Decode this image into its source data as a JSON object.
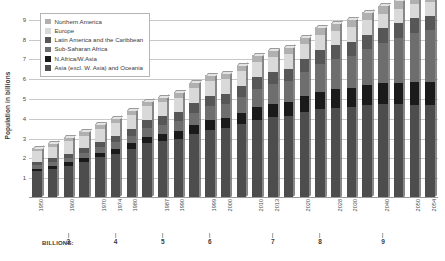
{
  "chart_data": {
    "type": "bar",
    "stacked": true,
    "title": "",
    "xlabel": "",
    "ylabel": "Population in billions",
    "ylim": [
      0,
      9.4
    ],
    "yticks": [
      1,
      2,
      3,
      4,
      5,
      6,
      7,
      8,
      9
    ],
    "grid": true,
    "legend_position": "top-left",
    "categories": [
      "1950",
      "1955",
      "1960",
      "1965",
      "1970",
      "1974",
      "1980",
      "1985",
      "1987",
      "1990",
      "1995",
      "1999",
      "2000",
      "2005",
      "2010",
      "2013",
      "2015",
      "2020",
      "2025",
      "2028",
      "2030",
      "2035",
      "2040",
      "2045",
      "2050",
      "2054"
    ],
    "tick_labels_shown": [
      "1950",
      "1960",
      "1970",
      "1974",
      "1980",
      "1987",
      "1990",
      "1999",
      "2000",
      "2010",
      "2013",
      "2020",
      "2028",
      "2030",
      "2040",
      "2050",
      "2054"
    ],
    "series": [
      {
        "name": "Asia (excl. W. Asia) and Oceania",
        "color": "#4d4d4d",
        "values": [
          1.36,
          1.49,
          1.64,
          1.83,
          2.06,
          2.25,
          2.49,
          2.76,
          2.87,
          2.99,
          3.26,
          3.46,
          3.52,
          3.74,
          3.96,
          4.08,
          4.15,
          4.35,
          4.5,
          4.57,
          4.61,
          4.69,
          4.73,
          4.73,
          4.71,
          4.69
        ]
      },
      {
        "name": "N.Africa/W.Asia",
        "color": "#1a1a1a",
        "values": [
          0.12,
          0.14,
          0.16,
          0.18,
          0.21,
          0.24,
          0.28,
          0.33,
          0.36,
          0.39,
          0.45,
          0.5,
          0.52,
          0.58,
          0.65,
          0.69,
          0.72,
          0.8,
          0.88,
          0.92,
          0.95,
          1.01,
          1.06,
          1.1,
          1.14,
          1.16
        ]
      },
      {
        "name": "Sub-Saharan Africa",
        "color": "#6e6e6e",
        "values": [
          0.18,
          0.2,
          0.23,
          0.26,
          0.29,
          0.32,
          0.38,
          0.44,
          0.48,
          0.52,
          0.61,
          0.68,
          0.7,
          0.8,
          0.92,
          0.99,
          1.04,
          1.22,
          1.41,
          1.53,
          1.61,
          1.82,
          2.04,
          2.26,
          2.49,
          2.62
        ]
      },
      {
        "name": "Latin America and the Caribbean",
        "color": "#575757",
        "values": [
          0.17,
          0.19,
          0.22,
          0.25,
          0.29,
          0.32,
          0.36,
          0.4,
          0.43,
          0.45,
          0.49,
          0.52,
          0.53,
          0.56,
          0.6,
          0.62,
          0.63,
          0.66,
          0.69,
          0.7,
          0.71,
          0.73,
          0.74,
          0.75,
          0.75,
          0.75
        ]
      },
      {
        "name": "Europe",
        "color": "#d9d9d9",
        "values": [
          0.55,
          0.58,
          0.61,
          0.64,
          0.66,
          0.68,
          0.69,
          0.71,
          0.72,
          0.72,
          0.73,
          0.73,
          0.73,
          0.73,
          0.74,
          0.74,
          0.74,
          0.75,
          0.74,
          0.74,
          0.74,
          0.73,
          0.72,
          0.71,
          0.7,
          0.69
        ]
      },
      {
        "name": "Northern America",
        "color": "#b0b0b0",
        "values": [
          0.17,
          0.19,
          0.2,
          0.22,
          0.23,
          0.24,
          0.25,
          0.27,
          0.27,
          0.28,
          0.3,
          0.31,
          0.31,
          0.33,
          0.34,
          0.36,
          0.36,
          0.38,
          0.4,
          0.41,
          0.41,
          0.43,
          0.44,
          0.45,
          0.46,
          0.47
        ]
      }
    ],
    "totals": [
      2.55,
      2.79,
      3.06,
      3.38,
      3.74,
      4.05,
      4.45,
      4.91,
      5.13,
      5.35,
      5.84,
      6.2,
      6.31,
      6.74,
      7.21,
      7.48,
      7.64,
      8.16,
      8.62,
      8.87,
      9.03,
      9.41,
      9.73,
      10.0,
      10.25,
      10.38
    ],
    "milestones": {
      "caption": "BILLIONS:",
      "points": [
        {
          "value": "3",
          "category": "1960"
        },
        {
          "value": "4",
          "category": "1974"
        },
        {
          "value": "5",
          "category": "1987"
        },
        {
          "value": "6",
          "category": "1999"
        },
        {
          "value": "7",
          "category": "2013"
        },
        {
          "value": "8",
          "category": "2025"
        },
        {
          "value": "9",
          "category": "2040"
        }
      ]
    }
  },
  "legend": {
    "items": [
      {
        "label": "Northern America",
        "color": "#b0b0b0"
      },
      {
        "label": "Europe",
        "color": "#d9d9d9"
      },
      {
        "label": "Latin America and the Caribbean",
        "color": "#575757"
      },
      {
        "label": "Sub-Saharan Africa",
        "color": "#6e6e6e"
      },
      {
        "label": "N.Africa/W.Asia",
        "color": "#1a1a1a"
      },
      {
        "label": "Asia (excl. W. Asia) and Oceania",
        "color": "#4d4d4d"
      }
    ]
  }
}
